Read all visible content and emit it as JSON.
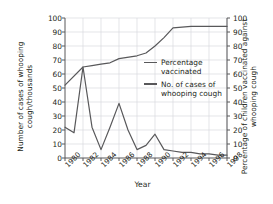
{
  "chart_data": {
    "type": "line",
    "title": "",
    "xlabel": "Year",
    "ylabel_left": "Number of cases of whooping cough/thousands",
    "ylabel_right": "Percentage of children vaccinated against whooping cough",
    "xlim": [
      1980,
      1998
    ],
    "ylim_left": [
      0,
      100
    ],
    "ylim_right": [
      0,
      100
    ],
    "grid": true,
    "legend_position": "center",
    "x_tick_labels": [
      "1980",
      "1982",
      "1984",
      "1986",
      "1988",
      "1990",
      "1992",
      "1994",
      "1996",
      "1998"
    ],
    "y_tick_labels_left": [
      "0",
      "10",
      "20",
      "30",
      "40",
      "50",
      "60",
      "70",
      "80",
      "90",
      "100"
    ],
    "y_tick_labels_right": [
      "0",
      "10",
      "20",
      "30",
      "40",
      "50",
      "60",
      "70",
      "80",
      "90",
      "100"
    ],
    "line_color": "#58585a",
    "grid_color": "#d9dade",
    "axis_color": "#58585a",
    "series": [
      {
        "name": "Percentage vaccinated",
        "legend_label": "Percentage\nvaccinated",
        "axis": "right",
        "x": [
          1980,
          1982,
          1983,
          1984,
          1985,
          1986,
          1988,
          1989,
          1990,
          1991,
          1992,
          1994,
          1996,
          1998
        ],
        "values": [
          52,
          65,
          66,
          67,
          68,
          71,
          73,
          75,
          80,
          86,
          93,
          94,
          94,
          94
        ]
      },
      {
        "name": "No. of cases of whooping cough",
        "legend_label": "No. of cases of\nwhooping cough",
        "axis": "left",
        "x": [
          1980,
          1981,
          1982,
          1983,
          1984,
          1985,
          1986,
          1987,
          1988,
          1989,
          1990,
          1991,
          1992,
          1993,
          1994,
          1995,
          1996,
          1997,
          1998
        ],
        "values": [
          22,
          18,
          65,
          22,
          6,
          22,
          39,
          20,
          6,
          9,
          17,
          6,
          5,
          4,
          4,
          3,
          3,
          2,
          2
        ]
      }
    ]
  }
}
